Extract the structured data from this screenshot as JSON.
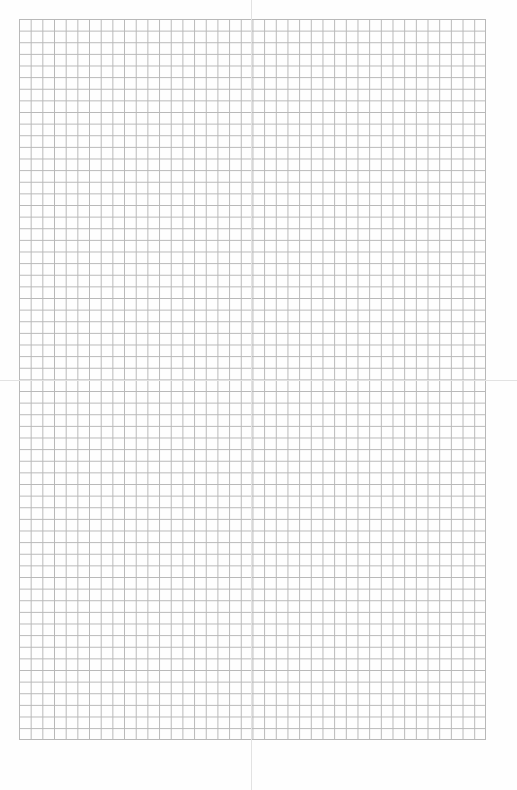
{
  "page": {
    "type": "graph-paper",
    "background_color": "#ffffff",
    "grid": {
      "line_color": "#b8b8b8",
      "columns": 40,
      "rows": 62,
      "left": 19,
      "top": 19,
      "right": 486,
      "bottom": 740
    },
    "fold_lines": {
      "color": "#e2e2e2",
      "vertical_x": 251,
      "horizontal_y": 380
    }
  }
}
